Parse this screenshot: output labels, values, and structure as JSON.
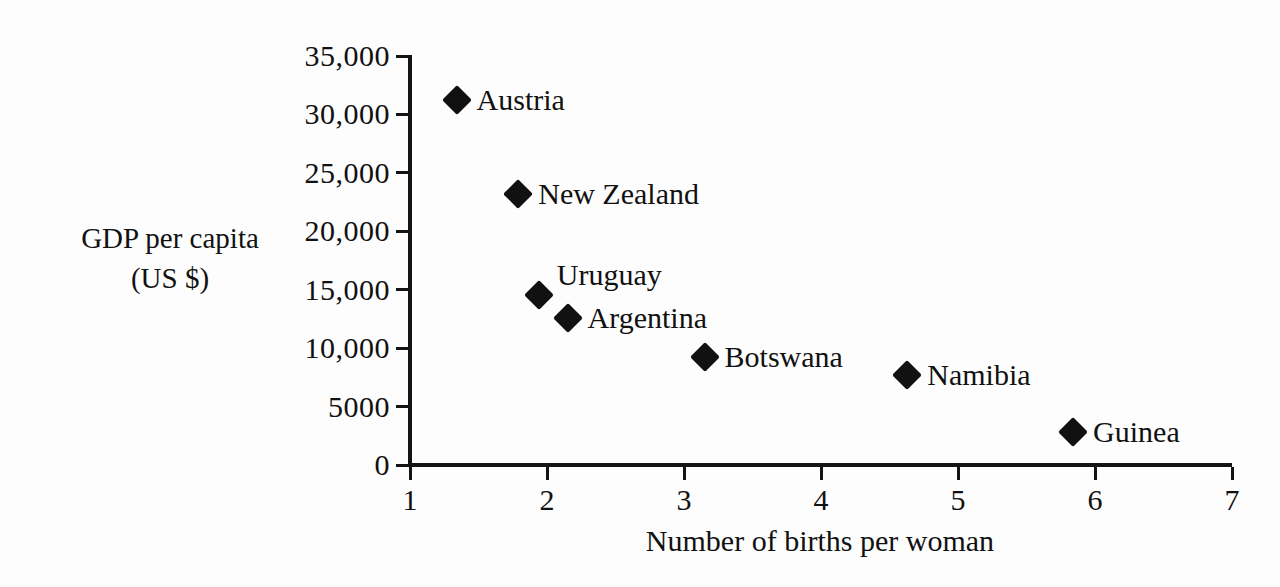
{
  "chart_data": {
    "type": "scatter",
    "title": "",
    "xlabel": "Number of births per woman",
    "ylabel_line1": "GDP per capita",
    "ylabel_line2": "(US $)",
    "xlim": [
      1,
      7
    ],
    "ylim": [
      0,
      35000
    ],
    "grid": false,
    "legend": "none",
    "marker_style": "filled-diamond",
    "marker_color": "#111111",
    "xticks": [
      "1",
      "2",
      "3",
      "4",
      "5",
      "6",
      "7"
    ],
    "xtick_values": [
      1,
      2,
      3,
      4,
      5,
      6,
      7
    ],
    "yticks": [
      "0",
      "5000",
      "10,000",
      "15,000",
      "20,000",
      "25,000",
      "30,000",
      "35,000"
    ],
    "ytick_values": [
      0,
      5000,
      10000,
      15000,
      20000,
      25000,
      30000,
      35000
    ],
    "points": [
      {
        "label": "Austria",
        "x": 1.34,
        "y": 31200,
        "label_pos": "right"
      },
      {
        "label": "New Zealand",
        "x": 1.79,
        "y": 23200,
        "label_pos": "right"
      },
      {
        "label": "Uruguay",
        "x": 1.94,
        "y": 14550,
        "label_pos": "above-right"
      },
      {
        "label": "Argentina",
        "x": 2.15,
        "y": 12550,
        "label_pos": "right"
      },
      {
        "label": "Botswana",
        "x": 3.15,
        "y": 9250,
        "label_pos": "right"
      },
      {
        "label": "Namibia",
        "x": 4.63,
        "y": 7700,
        "label_pos": "right"
      },
      {
        "label": "Guinea",
        "x": 5.84,
        "y": 2820,
        "label_pos": "right"
      }
    ]
  }
}
